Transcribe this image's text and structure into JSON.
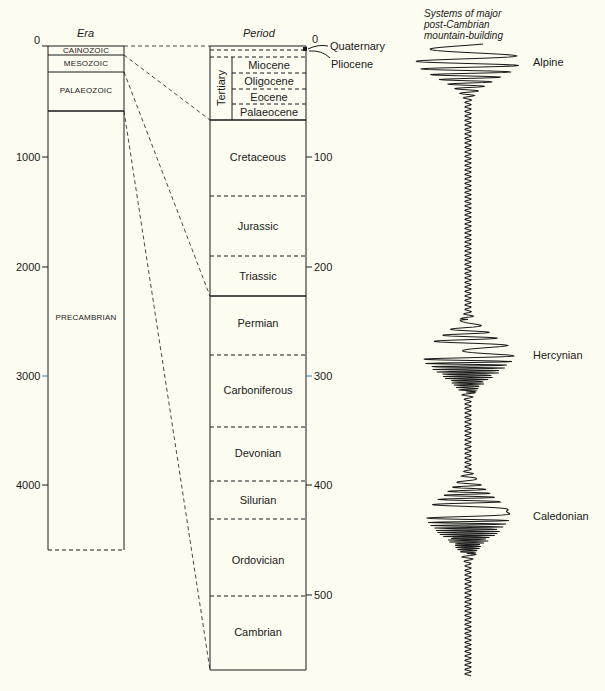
{
  "headers": {
    "era": "Era",
    "period": "Period",
    "mountain_building": [
      "Systems of major",
      "post-Cambrian",
      "mountain-building"
    ]
  },
  "era_scale": {
    "unit": "million years",
    "ticks": [
      "0",
      "1000",
      "2000",
      "3000",
      "4000"
    ]
  },
  "period_scale": {
    "unit": "million years",
    "ticks": [
      "0",
      "100",
      "200",
      "300",
      "400",
      "500"
    ]
  },
  "eras": [
    {
      "name": "CAINOZOIC"
    },
    {
      "name": "MESOZOIC"
    },
    {
      "name": "PALAEOZOIC"
    },
    {
      "name": "PRECAMBRIAN"
    }
  ],
  "tertiary_label": "Tertiary",
  "epochs": [
    {
      "name": "Miocene"
    },
    {
      "name": "Oligocene"
    },
    {
      "name": "Eocene"
    },
    {
      "name": "Palaeocene"
    }
  ],
  "callouts": {
    "quaternary": "Quaternary",
    "pliocene": "Pliocene"
  },
  "periods": [
    {
      "name": "Cretaceous"
    },
    {
      "name": "Jurassic"
    },
    {
      "name": "Triassic"
    },
    {
      "name": "Permian"
    },
    {
      "name": "Carboniferous"
    },
    {
      "name": "Devonian"
    },
    {
      "name": "Silurian"
    },
    {
      "name": "Ordovician"
    },
    {
      "name": "Cambrian"
    }
  ],
  "orogenies": [
    {
      "name": "Alpine"
    },
    {
      "name": "Hercynian"
    },
    {
      "name": "Caledonian"
    }
  ],
  "colors": {
    "background": "#fdfcf0",
    "ink": "#1a1a1a",
    "accent_tick": "#3a7bbf"
  }
}
